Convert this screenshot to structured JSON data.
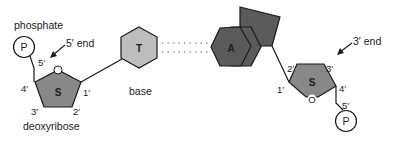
{
  "diagram": {
    "colors": {
      "sugar_fill": "#888888",
      "base_t_fill": "#bdbdbd",
      "base_a_fill": "#5a5a5a",
      "stroke": "#1a1a1a",
      "hbond_dots": "#9a9a9a"
    },
    "left_nucleotide": {
      "phosphate_label": "phosphate",
      "phosphate_symbol": "P",
      "end_label": "5′ end",
      "sugar_symbol": "S",
      "sugar_ring_oxygen": "O",
      "sugar_name": "deoxyribose",
      "carbons": {
        "c1": "1′",
        "c2": "2′",
        "c3": "3′",
        "c4": "4′",
        "c5": "5′"
      },
      "base_symbol": "T",
      "base_label": "base"
    },
    "right_nucleotide": {
      "phosphate_symbol": "P",
      "end_label": "3′ end",
      "sugar_symbol": "S",
      "sugar_ring_oxygen": "O",
      "carbons": {
        "c1": "1′",
        "c2": "2′",
        "c3": "3′",
        "c4": "4′",
        "c5": "5′"
      },
      "base_symbol": "A"
    }
  }
}
